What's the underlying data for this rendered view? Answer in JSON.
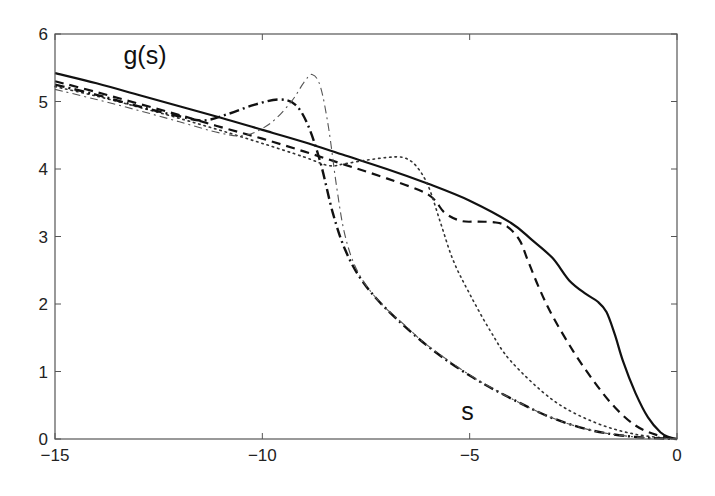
{
  "chart_data": {
    "type": "line",
    "title": "",
    "xlabel": "",
    "ylabel": "",
    "xlim": [
      -15,
      0
    ],
    "ylim": [
      0,
      6
    ],
    "grid": false,
    "legend": null,
    "x_ticks": [
      -15,
      -10,
      -5,
      0
    ],
    "x_tick_labels": [
      "−15",
      "−10",
      "−5",
      "0"
    ],
    "y_ticks": [
      0,
      1,
      2,
      3,
      4,
      5,
      6
    ],
    "y_tick_labels": [
      "0",
      "1",
      "2",
      "3",
      "4",
      "5",
      "6"
    ],
    "annotations": [
      {
        "text": "g(s)",
        "x": -13.35,
        "y": 5.55
      },
      {
        "text": "s",
        "x": -5.2,
        "y": 0.28
      }
    ],
    "series": [
      {
        "name": "solid",
        "style": "solid",
        "width": 2.2,
        "color": "#111111",
        "points": [
          [
            -15,
            5.42
          ],
          [
            -14,
            5.27
          ],
          [
            -13,
            5.1
          ],
          [
            -12,
            4.93
          ],
          [
            -11,
            4.76
          ],
          [
            -10,
            4.58
          ],
          [
            -9,
            4.4
          ],
          [
            -8,
            4.2
          ],
          [
            -7,
            4.0
          ],
          [
            -6,
            3.78
          ],
          [
            -5,
            3.53
          ],
          [
            -4,
            3.2
          ],
          [
            -3.5,
            2.95
          ],
          [
            -3,
            2.68
          ],
          [
            -2.6,
            2.35
          ],
          [
            -2.2,
            2.15
          ],
          [
            -1.9,
            2.03
          ],
          [
            -1.7,
            1.88
          ],
          [
            -1.5,
            1.55
          ],
          [
            -1.3,
            1.15
          ],
          [
            -1.0,
            0.68
          ],
          [
            -0.7,
            0.32
          ],
          [
            -0.4,
            0.1
          ],
          [
            -0.2,
            0.03
          ],
          [
            0,
            0
          ]
        ]
      },
      {
        "name": "dashed",
        "style": "dashed",
        "width": 2.2,
        "color": "#111111",
        "points": [
          [
            -15,
            5.3
          ],
          [
            -14,
            5.14
          ],
          [
            -13,
            4.97
          ],
          [
            -12,
            4.8
          ],
          [
            -11,
            4.62
          ],
          [
            -10,
            4.45
          ],
          [
            -9,
            4.26
          ],
          [
            -8,
            4.06
          ],
          [
            -7,
            3.86
          ],
          [
            -6,
            3.62
          ],
          [
            -5.6,
            3.35
          ],
          [
            -5.2,
            3.23
          ],
          [
            -4.8,
            3.22
          ],
          [
            -4.4,
            3.21
          ],
          [
            -4.1,
            3.15
          ],
          [
            -3.8,
            2.95
          ],
          [
            -3.6,
            2.65
          ],
          [
            -3.3,
            2.2
          ],
          [
            -3.0,
            1.82
          ],
          [
            -2.5,
            1.3
          ],
          [
            -2.0,
            0.85
          ],
          [
            -1.5,
            0.47
          ],
          [
            -1.0,
            0.2
          ],
          [
            -0.5,
            0.06
          ],
          [
            0,
            0
          ]
        ]
      },
      {
        "name": "dotted",
        "style": "dotted",
        "width": 1.6,
        "color": "#333333",
        "points": [
          [
            -15,
            5.22
          ],
          [
            -14,
            5.08
          ],
          [
            -13,
            4.92
          ],
          [
            -12,
            4.75
          ],
          [
            -11,
            4.57
          ],
          [
            -10,
            4.38
          ],
          [
            -9,
            4.18
          ],
          [
            -8.4,
            4.05
          ],
          [
            -8.0,
            4.08
          ],
          [
            -7.5,
            4.13
          ],
          [
            -7.0,
            4.17
          ],
          [
            -6.6,
            4.17
          ],
          [
            -6.3,
            4.05
          ],
          [
            -6.0,
            3.75
          ],
          [
            -5.7,
            3.2
          ],
          [
            -5.4,
            2.65
          ],
          [
            -5.0,
            2.15
          ],
          [
            -4.5,
            1.6
          ],
          [
            -4.0,
            1.15
          ],
          [
            -3.0,
            0.58
          ],
          [
            -2.0,
            0.25
          ],
          [
            -1.0,
            0.07
          ],
          [
            0,
            0
          ]
        ]
      },
      {
        "name": "thick-dash-dot",
        "style": "dashdot",
        "width": 2.4,
        "color": "#111111",
        "points": [
          [
            -15,
            5.25
          ],
          [
            -14,
            5.1
          ],
          [
            -13,
            4.93
          ],
          [
            -12,
            4.78
          ],
          [
            -11.4,
            4.72
          ],
          [
            -10.8,
            4.82
          ],
          [
            -10.2,
            4.95
          ],
          [
            -9.6,
            5.03
          ],
          [
            -9.2,
            4.95
          ],
          [
            -8.9,
            4.65
          ],
          [
            -8.6,
            4.1
          ],
          [
            -8.3,
            3.35
          ],
          [
            -8.0,
            2.8
          ],
          [
            -7.6,
            2.35
          ],
          [
            -7.0,
            1.92
          ],
          [
            -6.0,
            1.37
          ],
          [
            -5.0,
            0.94
          ],
          [
            -4.0,
            0.6
          ],
          [
            -3.0,
            0.31
          ],
          [
            -2.0,
            0.12
          ],
          [
            -1.0,
            0.03
          ],
          [
            0,
            0
          ]
        ]
      },
      {
        "name": "thin-dash-dot",
        "style": "dashdot-thin",
        "width": 1.1,
        "color": "#555555",
        "points": [
          [
            -15,
            5.18
          ],
          [
            -14,
            5.03
          ],
          [
            -13,
            4.87
          ],
          [
            -12,
            4.7
          ],
          [
            -11,
            4.53
          ],
          [
            -10.4,
            4.5
          ],
          [
            -9.8,
            4.68
          ],
          [
            -9.3,
            5.0
          ],
          [
            -9.0,
            5.28
          ],
          [
            -8.8,
            5.4
          ],
          [
            -8.6,
            5.22
          ],
          [
            -8.4,
            4.6
          ],
          [
            -8.2,
            3.7
          ],
          [
            -8.0,
            3.0
          ],
          [
            -7.7,
            2.48
          ],
          [
            -7.2,
            2.05
          ],
          [
            -6.5,
            1.65
          ],
          [
            -6.0,
            1.38
          ],
          [
            -5.0,
            0.95
          ],
          [
            -4.0,
            0.6
          ],
          [
            -3.0,
            0.31
          ],
          [
            -2.0,
            0.12
          ],
          [
            -1.0,
            0.03
          ],
          [
            0,
            0
          ]
        ]
      }
    ]
  }
}
